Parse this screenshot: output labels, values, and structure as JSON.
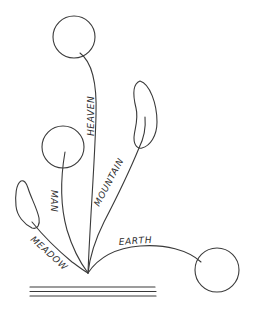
{
  "diagram": {
    "type": "ikebana-arrangement-sketch",
    "labels": {
      "heaven": "HEAVEN",
      "man": "MAN",
      "mountain": "MOUNTAIN",
      "meadow": "MEADOW",
      "earth": "EARTH"
    },
    "elements": [
      {
        "name": "heaven",
        "shape": "circle",
        "cx": 74,
        "cy": 37,
        "r": 21
      },
      {
        "name": "man",
        "shape": "circle",
        "cx": 63,
        "cy": 147,
        "r": 21
      },
      {
        "name": "earth",
        "shape": "circle",
        "cx": 217,
        "cy": 270,
        "r": 22
      },
      {
        "name": "mountain",
        "shape": "leaf"
      },
      {
        "name": "meadow",
        "shape": "leaf"
      }
    ],
    "origin_point": {
      "x": 88,
      "y": 273
    },
    "base_lines": 3,
    "colors": {
      "stroke": "#3a3a3a",
      "background": "#ffffff"
    }
  }
}
